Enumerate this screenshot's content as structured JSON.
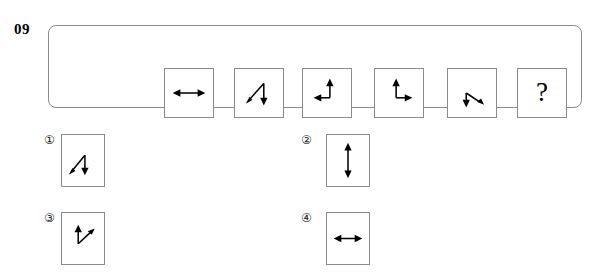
{
  "question": {
    "number": "09",
    "type": "visual-analogy-sequence",
    "unknown_marker": "?"
  },
  "sequence": {
    "label": "figure-sequence",
    "cells": [
      {
        "index": 1,
        "name": "sequence-figure-1",
        "description": "horizontal double-headed arrow",
        "arrows": [
          {
            "dir": "left",
            "angle_deg": 180
          },
          {
            "dir": "right",
            "angle_deg": 0
          }
        ]
      },
      {
        "index": 2,
        "name": "sequence-figure-2",
        "description": "bent line: arrowhead down-left and arrowhead down, vertex at top",
        "arrows": [
          {
            "dir": "down-left",
            "angle_deg": 215
          },
          {
            "dir": "down",
            "angle_deg": 270
          }
        ]
      },
      {
        "index": 3,
        "name": "sequence-figure-3",
        "description": "right-angle: arrowhead up and arrowhead left, vertex at bottom-right",
        "arrows": [
          {
            "dir": "up",
            "angle_deg": 90
          },
          {
            "dir": "left",
            "angle_deg": 180
          }
        ]
      },
      {
        "index": 4,
        "name": "sequence-figure-4",
        "description": "right-angle: arrowhead up and arrowhead right, vertex at bottom-left",
        "arrows": [
          {
            "dir": "up",
            "angle_deg": 90
          },
          {
            "dir": "right",
            "angle_deg": 0
          }
        ]
      },
      {
        "index": 5,
        "name": "sequence-figure-5",
        "description": "bent line: arrowhead down and arrowhead down-right, vertex at top",
        "arrows": [
          {
            "dir": "down",
            "angle_deg": 270
          },
          {
            "dir": "down-right",
            "angle_deg": 325
          }
        ]
      },
      {
        "index": 6,
        "name": "sequence-figure-missing",
        "description": "missing figure placeholder",
        "text": "?"
      }
    ]
  },
  "options": [
    {
      "id": 1,
      "marker": "①",
      "name": "option-1",
      "description": "bent line: arrowhead down-left and arrowhead down, vertex at top"
    },
    {
      "id": 2,
      "marker": "②",
      "name": "option-2",
      "description": "vertical double-headed arrow"
    },
    {
      "id": 3,
      "marker": "③",
      "name": "option-3",
      "description": "bent line: arrowhead up and arrowhead up-right, vertex at bottom"
    },
    {
      "id": 4,
      "marker": "④",
      "name": "option-4",
      "description": "horizontal double-headed arrow"
    }
  ],
  "colors": {
    "page_background": "#ffffff",
    "border": "#8a8a8a",
    "ink": "#000000"
  }
}
